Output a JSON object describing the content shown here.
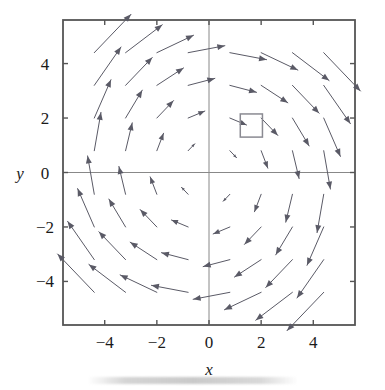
{
  "figure": {
    "kind": "vector-field-plot",
    "background_color": "#ffffff",
    "frame_color": "#555555",
    "axis_color": "#888888",
    "arrow_color": "#5a5a66",
    "marker_color": "#8a8a92",
    "text_color": "#1a1a1a"
  },
  "axes": {
    "x_title": "x",
    "y_title": "y",
    "x_ticks": [
      "−4",
      "−2",
      "0",
      "2",
      "4"
    ],
    "y_ticks": [
      "4",
      "2",
      "0",
      "−2",
      "−4"
    ],
    "x_tick_values": [
      -4,
      -2,
      0,
      2,
      4
    ],
    "y_tick_values": [
      4,
      2,
      0,
      -2,
      -4
    ]
  },
  "marker": {
    "name": "square-region",
    "x_min": 1.2,
    "x_max": 2.05,
    "y_min": 1.3,
    "y_max": 2.15
  },
  "chart_data": {
    "type": "scatter",
    "subtype": "quiver",
    "title": "",
    "xlabel": "x",
    "ylabel": "y",
    "xlim": [
      -5.6,
      5.6
    ],
    "ylim": [
      -5.6,
      5.6
    ],
    "grid": false,
    "legend": null,
    "field_formula": "F(x, y) = (y, -x)",
    "rotation": "clockwise",
    "grid_x": [
      -4.4,
      -3.2,
      -2.0,
      -0.8,
      0.8,
      2.0,
      3.2,
      4.4
    ],
    "grid_y": [
      -4.4,
      -3.2,
      -2.0,
      -0.8,
      0.8,
      2.0,
      3.2,
      4.4
    ],
    "arrow_scale": 0.32,
    "x_tick_labels": [
      "−4",
      "−2",
      "0",
      "2",
      "4"
    ],
    "y_tick_labels": [
      "4",
      "2",
      "0",
      "−2",
      "−4"
    ],
    "annotations": [
      {
        "type": "rectangle",
        "x_min": 1.2,
        "x_max": 2.05,
        "y_min": 1.3,
        "y_max": 2.15,
        "filled": false
      }
    ]
  }
}
